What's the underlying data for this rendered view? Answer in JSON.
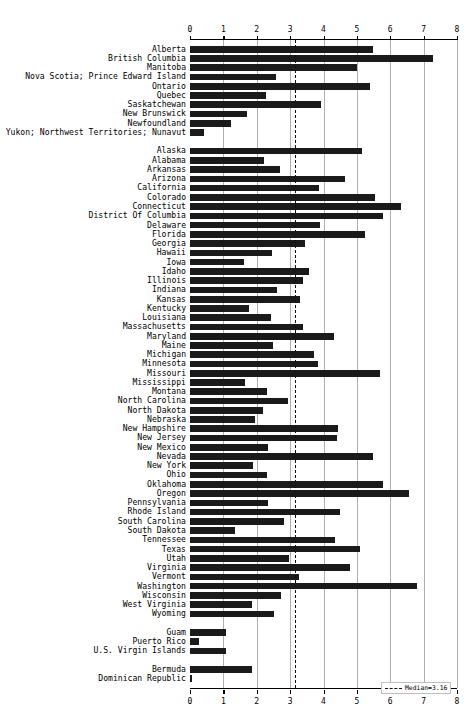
{
  "chart_data": {
    "type": "bar",
    "orientation": "horizontal",
    "title": "",
    "subtitle": "",
    "xlabel": "",
    "ylabel": "",
    "xlim": [
      0,
      8
    ],
    "xticks": [
      0,
      1,
      2,
      3,
      4,
      5,
      6,
      7,
      8
    ],
    "xtick_labels": [
      "0",
      "1",
      "2",
      "3",
      "4",
      "5",
      "6",
      "7",
      "8"
    ],
    "grid": true,
    "grid_axis": "x",
    "axis_top": true,
    "axis_bottom": true,
    "bar_color": "#1a1a1a",
    "grid_color": "#b0b0b0",
    "legend": {
      "position": "bottom-right",
      "entries": [
        {
          "label": "Median=3.16",
          "style": "dashed-line",
          "color": "#111111"
        }
      ]
    },
    "annotations": [
      {
        "type": "vline",
        "value": 3.16,
        "style": "dashed",
        "label": "Median=3.16",
        "color": "#111111"
      }
    ],
    "groups": [
      {
        "name": "Canada",
        "categories": [
          "Alberta",
          "British Columbia",
          "Manitoba",
          "Nova Scotia; Prince Edward Island",
          "Ontario",
          "Quebec",
          "Saskatchewan",
          "New Brunswick",
          "Newfoundland",
          "Yukon; Northwest Territories; Nunavut"
        ],
        "values": [
          5.48,
          7.28,
          5.0,
          2.58,
          5.4,
          2.27,
          3.92,
          1.72,
          1.22,
          0.42
        ]
      },
      {
        "name": "United States",
        "categories": [
          "Alaska",
          "Alabama",
          "Arkansas",
          "Arizona",
          "California",
          "Colorado",
          "Connecticut",
          "District Of Columbia",
          "Delaware",
          "Florida",
          "Georgia",
          "Hawaii",
          "Iowa",
          "Idaho",
          "Illinois",
          "Indiana",
          "Kansas",
          "Kentucky",
          "Louisiana",
          "Massachusetts",
          "Maryland",
          "Maine",
          "Michigan",
          "Minnesota",
          "Missouri",
          "Mississippi",
          "Montana",
          "North Carolina",
          "North Dakota",
          "Nebraska",
          "New Hampshire",
          "New Jersey",
          "New Mexico",
          "Nevada",
          "New York",
          "Ohio",
          "Oklahoma",
          "Oregon",
          "Pennsylvania",
          "Rhode Island",
          "South Carolina",
          "South Dakota",
          "Tennessee",
          "Texas",
          "Utah",
          "Virginia",
          "Vermont",
          "Washington",
          "Wisconsin",
          "West Virginia",
          "Wyoming"
        ],
        "values": [
          5.16,
          2.23,
          2.7,
          4.64,
          3.88,
          5.53,
          6.33,
          5.78,
          3.9,
          5.25,
          3.44,
          2.47,
          1.62,
          3.56,
          3.38,
          2.62,
          3.3,
          1.76,
          2.42,
          3.4,
          4.32,
          2.5,
          3.72,
          3.85,
          5.69,
          1.65,
          2.32,
          2.95,
          2.2,
          1.95,
          4.42,
          4.4,
          2.35,
          5.48,
          1.9,
          2.32,
          5.78,
          6.56,
          2.35,
          4.5,
          2.82,
          1.35,
          4.35,
          5.1,
          2.98,
          4.78,
          3.28,
          6.8,
          2.72,
          1.85,
          2.52
        ]
      },
      {
        "name": "US Territories",
        "categories": [
          "Guam",
          "Puerto Rico",
          "U.S. Virgin Islands"
        ],
        "values": [
          1.08,
          0.28,
          1.08
        ]
      },
      {
        "name": "Other",
        "categories": [
          "Bermuda",
          "Dominican Republic"
        ],
        "values": [
          1.85,
          0.05
        ]
      }
    ]
  }
}
